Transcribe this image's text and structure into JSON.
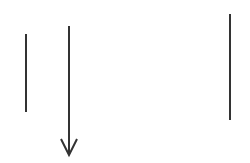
{
  "canvas": {
    "width": 250,
    "height": 163,
    "background": "#ffffff"
  },
  "stroke": {
    "color": "#333333",
    "width": 2
  },
  "elements": [
    {
      "type": "line",
      "name": "vertical-line-left",
      "x1": 26,
      "y1": 34,
      "x2": 26,
      "y2": 112
    },
    {
      "type": "arrow",
      "name": "down-arrow",
      "x1": 69,
      "y1": 26,
      "x2": 69,
      "y2": 155,
      "head_half_width": 8,
      "head_length": 16
    },
    {
      "type": "line",
      "name": "vertical-line-right",
      "x1": 230,
      "y1": 14,
      "x2": 230,
      "y2": 120
    }
  ]
}
